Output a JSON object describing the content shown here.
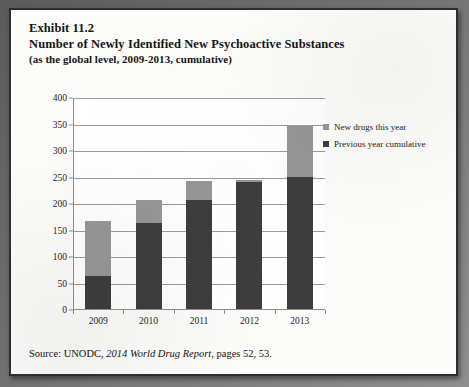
{
  "exhibit": {
    "label": "Exhibit 11.2",
    "title": "Number of Newly Identified New Psychoactive Substances",
    "subtitle": "(as the global level, 2009-2013, cumulative)"
  },
  "source": {
    "prefix": "Source: UNODC,",
    "report": "2014 World Drug Report",
    "suffix": ", pages 52, 53."
  },
  "legend": {
    "items": [
      {
        "label": "New drugs this year",
        "color": "#969696"
      },
      {
        "label": "Previous year cumulative",
        "color": "#3d3d3d"
      }
    ]
  },
  "axis": {
    "y_ticks": [
      "0",
      "50",
      "100",
      "150",
      "200",
      "250",
      "300",
      "350",
      "400"
    ],
    "x_ticks": [
      "2009",
      "2010",
      "2011",
      "2012",
      "2013"
    ]
  },
  "chart_data": {
    "type": "bar",
    "subtype": "stacked-column",
    "title": "Number of Newly Identified New Psychoactive Substances",
    "subtitle": "(as the global level, 2009-2013, cumulative)",
    "xlabel": "",
    "ylabel": "",
    "ylim": [
      0,
      400
    ],
    "ytick_step": 50,
    "grid": true,
    "legend_position": "right",
    "categories": [
      "2009",
      "2010",
      "2011",
      "2012",
      "2013"
    ],
    "series": [
      {
        "name": "Previous year cumulative",
        "color": "#3d3d3d",
        "values": [
          63,
          163,
          205,
          240,
          250
        ]
      },
      {
        "name": "New drugs this year",
        "color": "#969696",
        "values": [
          103,
          42,
          36,
          3,
          95
        ]
      }
    ],
    "totals": [
      166,
      205,
      241,
      243,
      345
    ]
  }
}
